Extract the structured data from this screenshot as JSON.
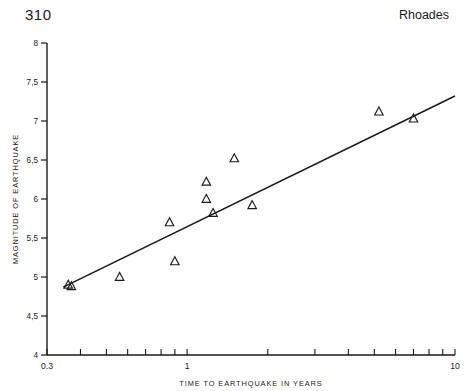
{
  "page": {
    "number": "310",
    "running_head": "Rhoades"
  },
  "chart_data": {
    "type": "scatter",
    "title": "",
    "xlabel": "TIME TO EARTHQUAKE IN YEARS",
    "ylabel": "MAGNITUDE OF EARTHQUAKE",
    "xscale": "log",
    "yscale": "linear",
    "xlim": [
      0.3,
      10
    ],
    "ylim": [
      4,
      8
    ],
    "grid": false,
    "legend": null,
    "xticklabels": [
      "0.3",
      "1",
      "10"
    ],
    "xticklabel_values": [
      0.3,
      1,
      10
    ],
    "yticklabels": [
      "8",
      "7,5",
      "7",
      "6,5",
      "6",
      "5,5",
      "5",
      "4,5",
      "4"
    ],
    "yticklabel_values": [
      8,
      7.5,
      7,
      6.5,
      6,
      5.5,
      5,
      4.5,
      4
    ],
    "marker": "triangle-up-open",
    "marker_color": "#1a1a1a",
    "points": [
      {
        "x": 0.36,
        "y": 4.9
      },
      {
        "x": 0.37,
        "y": 4.88
      },
      {
        "x": 0.56,
        "y": 5.0
      },
      {
        "x": 0.86,
        "y": 5.7
      },
      {
        "x": 0.9,
        "y": 5.2
      },
      {
        "x": 1.18,
        "y": 6.22
      },
      {
        "x": 1.18,
        "y": 6.0
      },
      {
        "x": 1.25,
        "y": 5.82
      },
      {
        "x": 1.5,
        "y": 6.52
      },
      {
        "x": 1.75,
        "y": 5.92
      },
      {
        "x": 5.2,
        "y": 7.12
      },
      {
        "x": 7.0,
        "y": 7.03
      }
    ],
    "fit_line": {
      "type": "linear-on-log-x",
      "x_start": 0.345,
      "y_start": 4.87,
      "x_end": 10.0,
      "y_end": 7.32,
      "color": "#1a1a1a"
    }
  }
}
